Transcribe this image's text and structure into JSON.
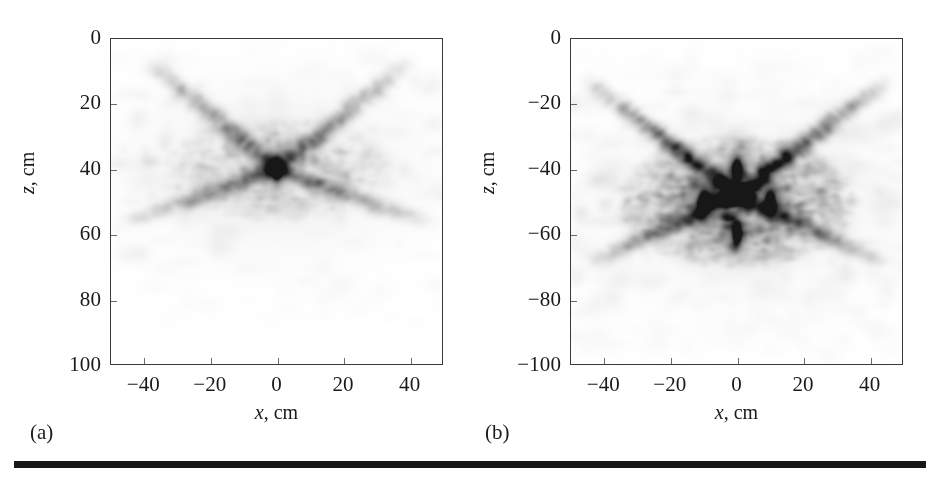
{
  "figure": {
    "background_color": "#ffffff",
    "ink_color": "#1a1a1a",
    "rule_color": "#16181c",
    "axis_color": "#3a3a3a"
  },
  "panels": [
    {
      "id": "a",
      "letter": "(a)",
      "xlabel_var": "x",
      "xlabel_unit": ", cm",
      "ylabel_var": "z",
      "ylabel_unit": ", cm",
      "xticks": [
        "-40",
        "-20",
        "0",
        "20",
        "40"
      ],
      "yticks": [
        "0",
        "20",
        "40",
        "60",
        "80",
        "100"
      ]
    },
    {
      "id": "b",
      "letter": "(b)",
      "xlabel_var": "x",
      "xlabel_unit": ", cm",
      "ylabel_var": "z",
      "ylabel_unit": ", cm",
      "xticks": [
        "-40",
        "-20",
        "0",
        "20",
        "40"
      ],
      "yticks": [
        "0",
        "-20",
        "-40",
        "-60",
        "-80",
        "-100"
      ]
    }
  ],
  "chart_data": [
    {
      "type": "heatmap",
      "panel": "a",
      "title": "",
      "xlabel": "x, cm",
      "ylabel": "z, cm",
      "xlim": [
        -50,
        50
      ],
      "ylim": [
        100,
        0
      ],
      "y_axis_direction": "increasing-downward",
      "xticks": [
        -40,
        -20,
        0,
        20,
        40
      ],
      "yticks": [
        0,
        20,
        40,
        60,
        80,
        100
      ],
      "grid": false,
      "legend": "none",
      "colormap": "grayscale-inverted",
      "description": "Single reconstructed point scatterer with faint X-shaped sidelobe streaks",
      "targets": [
        {
          "x": 0,
          "z": 40,
          "amplitude": 1.0,
          "width_cm": 2.0,
          "height_cm": 5.0
        }
      ],
      "sidelobes": [
        {
          "from_x": 0,
          "from_z": 40,
          "angle_deg": 40,
          "length_cm": 52,
          "amplitude": 0.11
        },
        {
          "from_x": 0,
          "from_z": 40,
          "angle_deg": 140,
          "length_cm": 52,
          "amplitude": 0.11
        },
        {
          "from_x": 0,
          "from_z": 40,
          "angle_deg": 200,
          "length_cm": 50,
          "amplitude": 0.08
        },
        {
          "from_x": 0,
          "from_z": 40,
          "angle_deg": 340,
          "length_cm": 50,
          "amplitude": 0.08
        }
      ]
    },
    {
      "type": "heatmap",
      "panel": "b",
      "title": "",
      "xlabel": "x, cm",
      "ylabel": "z, cm",
      "xlim": [
        -50,
        50
      ],
      "ylim": [
        -100,
        0
      ],
      "y_axis_direction": "decreasing-downward",
      "xticks": [
        -40,
        -20,
        0,
        20,
        40
      ],
      "yticks": [
        0,
        -20,
        -40,
        -60,
        -80,
        -100
      ],
      "grid": false,
      "legend": "none",
      "colormap": "grayscale-inverted",
      "description": "Four reconstructed point scatterers in a diamond arrangement with speckle and sidelobe clutter",
      "targets": [
        {
          "x": 0,
          "z": -40,
          "amplitude": 1.0,
          "width_cm": 2.2,
          "height_cm": 5.0
        },
        {
          "x": -10,
          "z": -50,
          "amplitude": 1.0,
          "width_cm": 2.4,
          "height_cm": 5.2
        },
        {
          "x": 10,
          "z": -50,
          "amplitude": 0.95,
          "width_cm": 2.2,
          "height_cm": 5.0
        },
        {
          "x": 0,
          "z": -60,
          "amplitude": 1.0,
          "width_cm": 2.2,
          "height_cm": 5.2
        }
      ],
      "sidelobes": [
        {
          "from_x": 0,
          "from_z": -48,
          "angle_deg": 38,
          "length_cm": 58,
          "amplitude": 0.16
        },
        {
          "from_x": 0,
          "from_z": -48,
          "angle_deg": 142,
          "length_cm": 58,
          "amplitude": 0.16
        },
        {
          "from_x": 0,
          "from_z": -48,
          "angle_deg": 205,
          "length_cm": 50,
          "amplitude": 0.12
        },
        {
          "from_x": 0,
          "from_z": -48,
          "angle_deg": 335,
          "length_cm": 50,
          "amplitude": 0.12
        }
      ]
    }
  ]
}
